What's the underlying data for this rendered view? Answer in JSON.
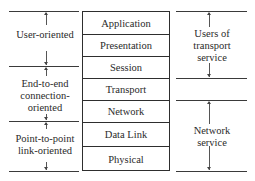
{
  "diagram": {
    "type": "OSI reference model layer grouping",
    "layers": [
      {
        "name": "Application"
      },
      {
        "name": "Presentation"
      },
      {
        "name": "Session"
      },
      {
        "name": "Transport"
      },
      {
        "name": "Network"
      },
      {
        "name": "Data Link"
      },
      {
        "name": "Physical"
      }
    ],
    "left_groups": [
      {
        "label": "User-oriented",
        "spans": [
          "Application",
          "Presentation"
        ]
      },
      {
        "label": "End-to-end connection-oriented",
        "label_lines": [
          "End-to-end",
          "connection-",
          "oriented"
        ],
        "spans": [
          "Session",
          "Transport",
          "Network"
        ]
      },
      {
        "label": "Point-to-point link-oriented",
        "label_lines": [
          "Point-to-point",
          "link-oriented"
        ],
        "spans": [
          "Data Link",
          "Physical"
        ]
      }
    ],
    "right_groups": [
      {
        "label": "Users of transport service",
        "label_lines": [
          "Users of",
          "transport",
          "service"
        ],
        "spans": [
          "Application",
          "Presentation",
          "Session"
        ]
      },
      {
        "label": "Network service",
        "label_lines": [
          "Network",
          "service"
        ],
        "spans": [
          "Transport",
          "Network",
          "Data Link",
          "Physical"
        ]
      }
    ],
    "caption_partial": "FIGURE (cut off)"
  }
}
